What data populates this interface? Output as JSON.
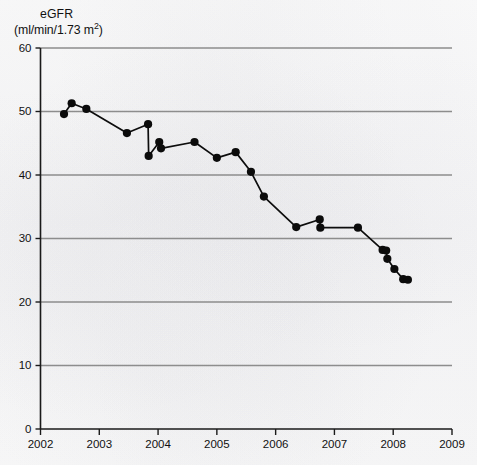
{
  "figure": {
    "y_axis_title_line1": "eGFR",
    "y_axis_units_prefix": "(ml/min/1.73 m",
    "y_axis_units_exponent": "2",
    "y_axis_units_suffix": ")"
  },
  "chart_data": {
    "type": "line",
    "title": "",
    "xlabel": "",
    "ylabel": "eGFR (ml/min/1.73 m2)",
    "xlim": [
      2002,
      2009
    ],
    "ylim": [
      0,
      60
    ],
    "xticks": [
      "2002",
      "2003",
      "2004",
      "2005",
      "2006",
      "2007",
      "2008",
      "2009"
    ],
    "yticks": [
      "0",
      "10",
      "20",
      "30",
      "40",
      "50",
      "60"
    ],
    "grid": "horizontal",
    "legend": "none",
    "marker": "filled-circle",
    "series": [
      {
        "name": "eGFR",
        "x": [
          2002.4,
          2002.53,
          2002.78,
          2003.47,
          2003.83,
          2003.84,
          2004.02,
          2004.05,
          2004.62,
          2005.0,
          2005.32,
          2005.58,
          2005.8,
          2006.35,
          2006.75,
          2006.76,
          2007.4,
          2007.82,
          2007.88,
          2007.9,
          2008.02,
          2008.17,
          2008.25
        ],
        "y": [
          49.6,
          51.3,
          50.4,
          46.6,
          48.0,
          43.0,
          45.2,
          44.2,
          45.2,
          42.7,
          43.6,
          40.5,
          36.6,
          31.8,
          33.0,
          31.7,
          31.7,
          28.2,
          28.1,
          26.8,
          25.2,
          23.6,
          23.5
        ]
      }
    ]
  }
}
